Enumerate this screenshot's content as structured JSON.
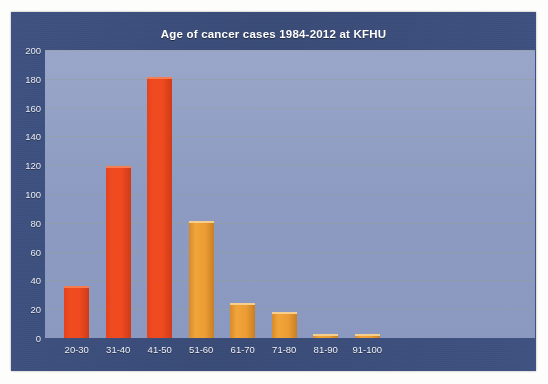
{
  "chart_data": {
    "type": "bar",
    "title": "Age of cancer cases 1984-2012 at KFHU",
    "xlabel": "",
    "ylabel": "",
    "categories": [
      "20-30",
      "31-40",
      "41-50",
      "51-60",
      "61-70",
      "71-80",
      "81-90",
      "91-100"
    ],
    "values": [
      35,
      118,
      180,
      80,
      23,
      17,
      1,
      1
    ],
    "ylim": [
      0,
      200
    ],
    "ytick_labels": [
      "200",
      "180",
      "160",
      "140",
      "120",
      "100",
      "80",
      "60",
      "40",
      "20",
      "0"
    ],
    "ytick_values": [
      200,
      180,
      160,
      140,
      120,
      100,
      80,
      60,
      40,
      20,
      0
    ],
    "grid": true,
    "legend": "none",
    "bar_colors": [
      "#ef4a20",
      "#ef4a20",
      "#ef4a20",
      "#ec9c33",
      "#ec9c33",
      "#ec9c33",
      "#ec9c33",
      "#ec9c33"
    ],
    "series": [
      {
        "name": "Cancer cases",
        "values": [
          35,
          118,
          180,
          80,
          23,
          17,
          1,
          1
        ]
      }
    ]
  },
  "colors": {
    "chart_background": "#3c4e7b",
    "plot_background": "#8d9bc2",
    "bar_red": "#ef4a20",
    "bar_orange": "#ec9c33",
    "axis_text": "#eef0f6",
    "gridline": "#96a0a0",
    "page_background": "#fdfdfb"
  }
}
